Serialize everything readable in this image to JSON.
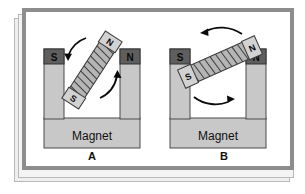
{
  "figure": {
    "type": "physics-diagram",
    "panels": [
      {
        "id": "A",
        "label": "A",
        "magnet": {
          "body_label": "Magnet",
          "left_pole": "S",
          "right_pole": "N"
        },
        "coil": {
          "top_end_label": "N",
          "bottom_end_label": "S",
          "orientation_deg": 33,
          "turns": 9
        },
        "arrows": [
          {
            "name": "rotation-arrow-left",
            "direction": "down-left"
          },
          {
            "name": "rotation-arrow-right",
            "direction": "up-right"
          }
        ]
      },
      {
        "id": "B",
        "label": "B",
        "magnet": {
          "body_label": "Magnet",
          "left_pole": "S",
          "right_pole": "N"
        },
        "coil": {
          "left_end_label": "S",
          "right_end_label": "N",
          "orientation_deg": -24,
          "turns": 9
        },
        "arrows": [
          {
            "name": "rotation-arrow-top",
            "direction": "left"
          },
          {
            "name": "rotation-arrow-bottom",
            "direction": "right"
          }
        ]
      }
    ],
    "colors": {
      "frame": "#8d8d8d",
      "paper": "#ffffff",
      "magnet_body": "#c8c8c8",
      "pole_block": "#5e5e5e",
      "coil_body": "#b5b5b5",
      "ink": "#111111",
      "stack_shadow": "#efefef"
    }
  }
}
